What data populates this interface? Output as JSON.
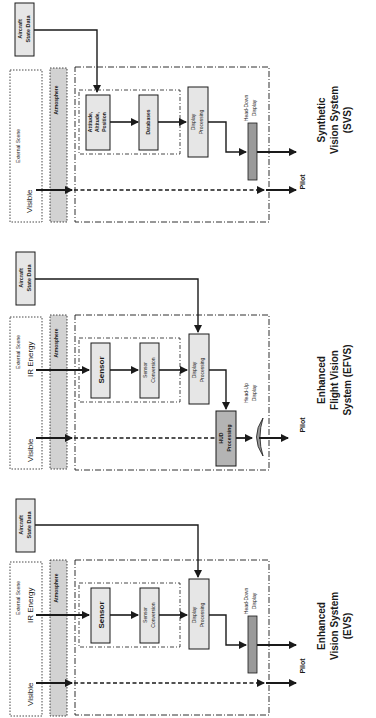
{
  "diagram": {
    "orientation": "rotated 90deg counter-clockwise",
    "colors": {
      "line": "#1a1a1a",
      "box_fill": "#e6e6e6",
      "atmosphere_fill": "#d2d2d2",
      "display_bar_fill": "#9a9a9a",
      "background": "#ffffff"
    },
    "common": {
      "aircraft_state_data": [
        "Aircraft",
        "State Data"
      ],
      "external_scene": "External Scene",
      "atmosphere": "Atmosphere",
      "visible": "Visible",
      "ir_energy": "IR Energy",
      "pilot": "Pilot"
    },
    "panels": [
      {
        "id": "svs",
        "title": [
          "Synthetic",
          "Vision System",
          "(SVS)"
        ],
        "has_ir": false,
        "inner_boxes": [
          {
            "label": [
              "Attitude,",
              "Altitude,",
              "Position"
            ]
          },
          {
            "label": [
              "Databases"
            ]
          }
        ],
        "display_processing": [
          "Display",
          "Processing"
        ],
        "display": [
          "Head-Down",
          "Display"
        ],
        "display_type": "head-down"
      },
      {
        "id": "efvs",
        "title": [
          "Enhanced",
          "Flight Vision",
          "System (EFVS)"
        ],
        "has_ir": true,
        "inner_boxes": [
          {
            "label": [
              "Sensor"
            ]
          },
          {
            "label": [
              "Sensor",
              "Conversion"
            ]
          }
        ],
        "display_processing": [
          "Display",
          "Processing"
        ],
        "hud_processing": [
          "HUD",
          "Processing"
        ],
        "display": [
          "Head-Up",
          "Display"
        ],
        "display_type": "head-up"
      },
      {
        "id": "evs",
        "title": [
          "Enhanced",
          "Vision System",
          "(EVS)"
        ],
        "has_ir": true,
        "inner_boxes": [
          {
            "label": [
              "Sensor"
            ]
          },
          {
            "label": [
              "Sensor",
              "Conversion"
            ]
          }
        ],
        "display_processing": [
          "Display",
          "Processing"
        ],
        "display": [
          "Head-Down",
          "Display"
        ],
        "display_type": "head-down"
      }
    ]
  }
}
